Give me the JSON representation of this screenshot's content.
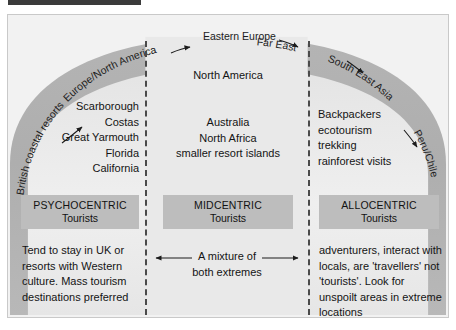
{
  "figure": {
    "background_color": "#eeeeee",
    "dome_light_color": "#d4d4d4",
    "dome_dark_color": "#a8a8a8",
    "box_color": "#bdbdbd"
  },
  "arc_labels": [
    {
      "id": "british-coastal-resorts",
      "text": "British coastal resorts"
    },
    {
      "id": "europe-north-america",
      "text": "Europe/North America"
    },
    {
      "id": "eastern-europe",
      "text": "Eastern Europe"
    },
    {
      "id": "far-east",
      "text": "Far East"
    },
    {
      "id": "south-east-asia",
      "text": "South East Asia"
    },
    {
      "id": "peru-chile",
      "text": "Peru/Chile"
    }
  ],
  "columns": {
    "left": {
      "destinations": "Scarborough\nCostas\nGreat Yarmouth\nFlorida\nCalifornia",
      "type_label_top": "PSYCHOCENTRIC",
      "type_label_bottom": "Tourists",
      "description": "Tend to stay in UK or resorts with Western culture. Mass tourism destinations preferred"
    },
    "middle": {
      "heading": "North America",
      "destinations": "Australia\nNorth Africa\nsmaller resort islands",
      "type_label_top": "MIDCENTRIC",
      "type_label_bottom": "Tourists",
      "description": "A mixture of\nboth extremes"
    },
    "right": {
      "destinations": "Backpackers\necotourism\ntrekking\nrainforest visits",
      "type_label_top": "ALLOCENTRIC",
      "type_label_bottom": "Tourists",
      "description": "adventurers, interact with locals, are 'travellers' not 'tourists'. Look for unspoilt areas in extreme locations"
    }
  }
}
